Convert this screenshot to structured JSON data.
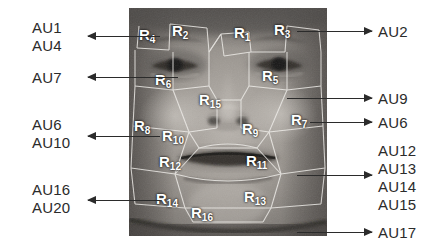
{
  "figure": {
    "type": "annotated-face-diagram"
  },
  "left_labels": [
    {
      "name": "au1",
      "text": "AU1",
      "x": 32,
      "y": 20
    },
    {
      "name": "au4",
      "text": "AU4",
      "x": 32,
      "y": 38
    },
    {
      "name": "au7",
      "text": "AU7",
      "x": 32,
      "y": 70
    },
    {
      "name": "au6",
      "text": "AU6",
      "x": 32,
      "y": 117
    },
    {
      "name": "au10",
      "text": "AU10",
      "x": 32,
      "y": 135
    },
    {
      "name": "au16",
      "text": "AU16",
      "x": 32,
      "y": 182
    },
    {
      "name": "au20",
      "text": "AU20",
      "x": 32,
      "y": 200
    }
  ],
  "right_labels": [
    {
      "name": "au2",
      "text": "AU2",
      "x": 378,
      "y": 24
    },
    {
      "name": "au9",
      "text": "AU9",
      "x": 378,
      "y": 91
    },
    {
      "name": "au6r",
      "text": "AU6",
      "x": 378,
      "y": 115
    },
    {
      "name": "au12",
      "text": "AU12",
      "x": 378,
      "y": 143
    },
    {
      "name": "au13",
      "text": "AU13",
      "x": 378,
      "y": 161
    },
    {
      "name": "au14",
      "text": "AU14",
      "x": 378,
      "y": 179
    },
    {
      "name": "au15",
      "text": "AU15",
      "x": 378,
      "y": 197
    },
    {
      "name": "au17",
      "text": "AU17",
      "x": 378,
      "y": 225
    }
  ],
  "left_arrows": [
    {
      "name": "arrow-au1-au4",
      "x": 88,
      "y": 32,
      "w": 72
    },
    {
      "name": "arrow-au7",
      "x": 88,
      "y": 73,
      "w": 90
    },
    {
      "name": "arrow-au6-au10",
      "x": 88,
      "y": 132,
      "w": 72
    },
    {
      "name": "arrow-au16-au20",
      "x": 88,
      "y": 196,
      "w": 72
    }
  ],
  "right_arrows": [
    {
      "name": "arrow-au2",
      "x": 297,
      "y": 27,
      "w": 75
    },
    {
      "name": "arrow-au9",
      "x": 287,
      "y": 94,
      "w": 85
    },
    {
      "name": "arrow-au6r",
      "x": 310,
      "y": 118,
      "w": 62
    },
    {
      "name": "arrow-au13",
      "x": 297,
      "y": 171,
      "w": 75
    },
    {
      "name": "arrow-au17",
      "x": 297,
      "y": 228,
      "w": 75
    }
  ],
  "region_labels": [
    {
      "name": "region-r4",
      "base": "R",
      "sub": "4",
      "x": 10,
      "y": 19
    },
    {
      "name": "region-r2",
      "base": "R",
      "sub": "2",
      "x": 43,
      "y": 15
    },
    {
      "name": "region-r1",
      "base": "R",
      "sub": "1",
      "x": 105,
      "y": 17
    },
    {
      "name": "region-r3",
      "base": "R",
      "sub": "3",
      "x": 145,
      "y": 14
    },
    {
      "name": "region-r6",
      "base": "R",
      "sub": "6",
      "x": 26,
      "y": 64
    },
    {
      "name": "region-r5",
      "base": "R",
      "sub": "5",
      "x": 133,
      "y": 60
    },
    {
      "name": "region-r15",
      "base": "R",
      "sub": "15",
      "x": 70,
      "y": 84
    },
    {
      "name": "region-r8",
      "base": "R",
      "sub": "8",
      "x": 5,
      "y": 110
    },
    {
      "name": "region-r10",
      "base": "R",
      "sub": "10",
      "x": 33,
      "y": 120
    },
    {
      "name": "region-r9",
      "base": "R",
      "sub": "9",
      "x": 113,
      "y": 113
    },
    {
      "name": "region-r7",
      "base": "R",
      "sub": "7",
      "x": 162,
      "y": 104
    },
    {
      "name": "region-r12",
      "base": "R",
      "sub": "12",
      "x": 30,
      "y": 146
    },
    {
      "name": "region-r11",
      "base": "R",
      "sub": "11",
      "x": 117,
      "y": 145
    },
    {
      "name": "region-r14",
      "base": "R",
      "sub": "14",
      "x": 27,
      "y": 183
    },
    {
      "name": "region-r13",
      "base": "R",
      "sub": "13",
      "x": 115,
      "y": 181
    },
    {
      "name": "region-r16",
      "base": "R",
      "sub": "16",
      "x": 62,
      "y": 197
    }
  ],
  "colors": {
    "text": "#2b2b2b",
    "region_text": "#ffffff",
    "arrow": "#2b2b2b",
    "mesh": "#f0f0f0",
    "background": "#ffffff"
  }
}
